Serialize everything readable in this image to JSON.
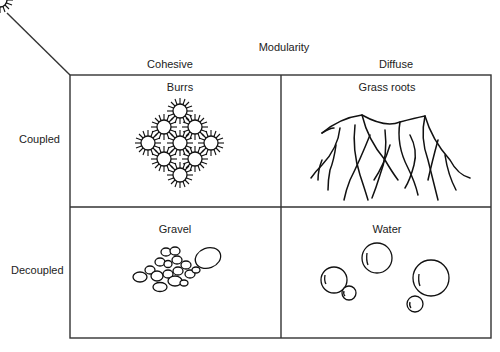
{
  "axis": {
    "top_title": "Modularity",
    "columns": [
      "Cohesive",
      "Diffuse"
    ],
    "rows": [
      "Coupled",
      "Decoupled"
    ]
  },
  "cells": [
    {
      "label": "Burrs",
      "icon": "burrs-illustration"
    },
    {
      "label": "Grass roots",
      "icon": "grass-roots-illustration"
    },
    {
      "label": "Gravel",
      "icon": "gravel-illustration"
    },
    {
      "label": "Water",
      "icon": "water-droplets-illustration"
    }
  ],
  "colors": {
    "line": "#333333",
    "background": "#ffffff"
  }
}
